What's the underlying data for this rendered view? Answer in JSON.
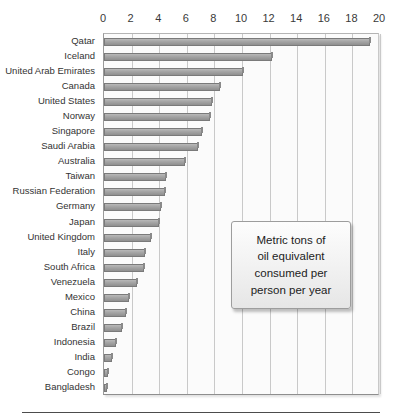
{
  "annotation": {
    "text": "Metric tons of oil equivalent consumed per person per year",
    "line1": "Metric tons of",
    "line2": "oil equivalent",
    "line3": "consumed per",
    "line4": "person per year"
  },
  "style": {
    "bar_fill": "#a6a6a6",
    "bar_border": "#7a7a7a",
    "plot_background": "#fbfbfb",
    "gridline_color": "#c9c9c9",
    "text_color": "#333333"
  },
  "chart_data": {
    "type": "bar",
    "orientation": "horizontal",
    "title": "",
    "subtitle": "",
    "xlabel": "",
    "ylabel": "",
    "xlim": [
      0,
      20
    ],
    "xticks": [
      0,
      2,
      4,
      6,
      8,
      10,
      12,
      14,
      16,
      18,
      20
    ],
    "grid": true,
    "legend": false,
    "legend_position": "none",
    "annotation": "Metric tons of oil equivalent consumed per person per year",
    "units": "metric tons of oil equivalent per person per year",
    "categories": [
      "Qatar",
      "Iceland",
      "United Arab Emirates",
      "Canada",
      "United States",
      "Norway",
      "Singapore",
      "Saudi Arabia",
      "Australia",
      "Taiwan",
      "Russian Federation",
      "Germany",
      "Japan",
      "United Kingdom",
      "Italy",
      "South Africa",
      "Venezuela",
      "Mexico",
      "China",
      "Brazil",
      "Indonesia",
      "India",
      "Congo",
      "Bangladesh"
    ],
    "values": [
      19.3,
      12.2,
      10.1,
      8.4,
      7.8,
      7.7,
      7.1,
      6.8,
      5.9,
      4.5,
      4.4,
      4.1,
      4.0,
      3.4,
      3.0,
      2.9,
      2.4,
      1.8,
      1.6,
      1.3,
      0.9,
      0.55,
      0.3,
      0.2
    ]
  }
}
